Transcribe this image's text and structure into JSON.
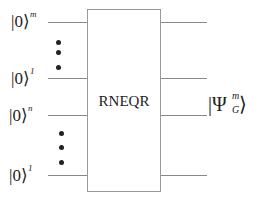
{
  "inputs": [
    {
      "label": "|0⟩",
      "exponent": "m"
    },
    {
      "label": "|0⟩",
      "exponent": "1"
    },
    {
      "label": "|0⟩",
      "exponent": "n"
    },
    {
      "label": "|0⟩",
      "exponent": "1"
    }
  ],
  "gate": {
    "label": "RNEQR"
  },
  "output": {
    "psi": "Ψ",
    "sup": "m",
    "sub": "G",
    "open": "|",
    "close": "⟩"
  }
}
